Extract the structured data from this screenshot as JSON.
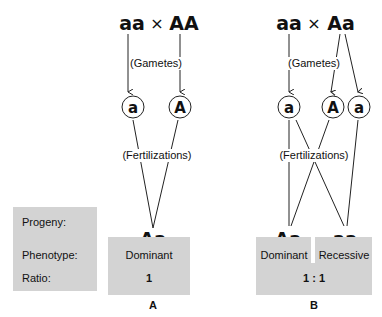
{
  "row_labels": {
    "progeny": "Progeny:",
    "phenotype": "Phenotype:",
    "ratio": "Ratio:"
  },
  "panel_a": {
    "label": "A",
    "parent1": "aa",
    "cross_symbol": "×",
    "parent2": "AA",
    "gametes_note": "(Gametes)",
    "gametes": [
      "a",
      "A"
    ],
    "fertilizations_note": "(Fertilizations)",
    "progeny": [
      "Aa"
    ],
    "phenotypes": [
      "Dominant"
    ],
    "ratio": "1"
  },
  "panel_b": {
    "label": "B",
    "parent1": "aa",
    "cross_symbol": "×",
    "parent2": "Aa",
    "gametes_note": "(Gametes)",
    "gametes": [
      "a",
      "A",
      "a"
    ],
    "fertilizations_note": "(Fertilizations)",
    "progeny": [
      "Aa",
      "aa"
    ],
    "phenotypes": [
      "Dominant",
      "Recessive"
    ],
    "ratio": "1 : 1"
  },
  "colors": {
    "box_fill": "#d3d3d3",
    "line": "#222222"
  }
}
